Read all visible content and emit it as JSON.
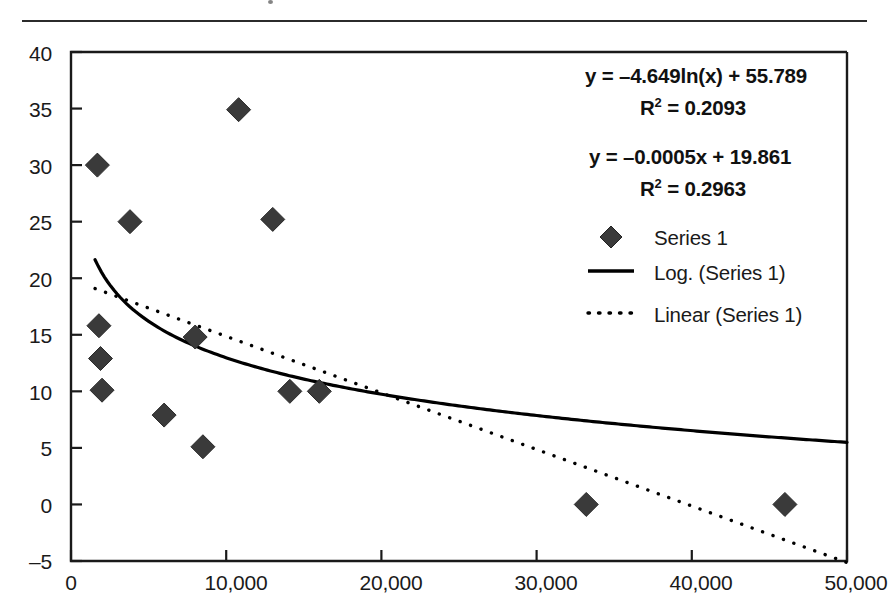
{
  "chart_data": {
    "type": "scatter",
    "title": "",
    "xlabel": "",
    "ylabel": "",
    "xlim": [
      0,
      50000
    ],
    "ylim": [
      -5,
      40
    ],
    "grid": false,
    "legend_position": "right",
    "x_ticks": [
      "0",
      "10,000",
      "20,000",
      "30,000",
      "40,000",
      "50,000"
    ],
    "x_tick_values": [
      0,
      10000,
      20000,
      30000,
      40000,
      50000
    ],
    "y_ticks": [
      "40",
      "35",
      "30",
      "25",
      "20",
      "15",
      "10",
      "5",
      "0",
      "–5"
    ],
    "y_tick_values": [
      40,
      35,
      30,
      25,
      20,
      15,
      10,
      5,
      0,
      -5
    ],
    "series": [
      {
        "name": "Series 1",
        "marker": "diamond",
        "color": "#3a3a3a",
        "points": [
          {
            "x": 1700,
            "y": 30.0
          },
          {
            "x": 1800,
            "y": 15.8
          },
          {
            "x": 1900,
            "y": 12.9
          },
          {
            "x": 3800,
            "y": 25.0
          },
          {
            "x": 2000,
            "y": 10.1
          },
          {
            "x": 6000,
            "y": 7.9
          },
          {
            "x": 8000,
            "y": 14.8
          },
          {
            "x": 8500,
            "y": 5.1
          },
          {
            "x": 10800,
            "y": 34.9
          },
          {
            "x": 13000,
            "y": 25.2
          },
          {
            "x": 14100,
            "y": 10.0
          },
          {
            "x": 16000,
            "y": 10.0
          },
          {
            "x": 33200,
            "y": 0.0
          },
          {
            "x": 46000,
            "y": 0.0
          }
        ]
      },
      {
        "name": "Log. (Series 1)",
        "type": "line",
        "style": "solid",
        "color": "#000000",
        "equation": "y = –4.649ln(x) + 55.789",
        "r_squared": 0.2093,
        "coef_a": -4.649,
        "coef_b": 55.789,
        "x_start": 1550,
        "x_end": 50000
      },
      {
        "name": "Linear (Series 1)",
        "type": "line",
        "style": "dotted",
        "color": "#000000",
        "equation": "y = –0.0005x + 19.861",
        "r_squared": 0.2963,
        "slope": -0.0005,
        "intercept": 19.861,
        "x_start": 1550,
        "x_end": 50000
      }
    ]
  },
  "annotations": {
    "log_equation": "y = –4.649ln(x) + 55.789",
    "log_r2_prefix": "R",
    "log_r2_exponent": "2",
    "log_r2_value": " = 0.2093",
    "linear_equation": "y = –0.0005x + 19.861",
    "linear_r2_prefix": "R",
    "linear_r2_exponent": "2",
    "linear_r2_value": " = 0.2963"
  },
  "legend": {
    "items": [
      {
        "label": "Series 1",
        "glyph": "diamond-marker"
      },
      {
        "label": "Log. (Series 1)",
        "glyph": "solid-line"
      },
      {
        "label": "Linear (Series 1)",
        "glyph": "dotted-line"
      }
    ]
  },
  "colors": {
    "marker": "#3a3a3a",
    "axis": "#1a1a1a",
    "trend": "#000000",
    "background": "#ffffff"
  }
}
